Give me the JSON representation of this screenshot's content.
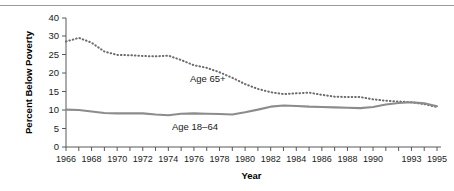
{
  "chart_data": {
    "type": "line",
    "title": "",
    "subtitle": "",
    "xlabel": "Year",
    "ylabel": "Percent Below Poverty",
    "xlim": [
      1966,
      1995
    ],
    "ylim": [
      0,
      40
    ],
    "grid": false,
    "legend_position": "inline-annotations",
    "x": [
      1966,
      1967,
      1968,
      1969,
      1970,
      1971,
      1972,
      1973,
      1974,
      1975,
      1976,
      1977,
      1978,
      1979,
      1980,
      1981,
      1982,
      1983,
      1984,
      1985,
      1986,
      1987,
      1988,
      1989,
      1990,
      1991,
      1992,
      1993,
      1994,
      1995
    ],
    "y_tick_labels": [
      "0",
      "5",
      "10",
      "15",
      "20",
      "25",
      "30",
      "40"
    ],
    "y_tick_values": [
      0,
      5,
      10,
      15,
      20,
      25,
      30,
      40
    ],
    "x_tick_labels": [
      "1966",
      "1968",
      "1970",
      "1972",
      "1974",
      "1976",
      "1978",
      "1980",
      "1982",
      "1984",
      "1986",
      "1988",
      "1990",
      "1993",
      "1995"
    ],
    "x_tick_values": [
      1966,
      1968,
      1970,
      1972,
      1974,
      1976,
      1978,
      1980,
      1982,
      1984,
      1986,
      1988,
      1990,
      1993,
      1995
    ],
    "series": [
      {
        "name": "Age 65+",
        "style": "dotted",
        "color": "#6b6b6b",
        "label_text": "Age 65+",
        "values": [
          28.5,
          29.5,
          28.2,
          25.8,
          24.9,
          24.8,
          24.6,
          24.5,
          24.7,
          23.5,
          22.1,
          21.4,
          20.2,
          18.7,
          17.0,
          15.7,
          14.8,
          14.3,
          14.5,
          14.7,
          14.1,
          13.6,
          13.5,
          13.5,
          12.9,
          12.5,
          12.3,
          12.1,
          11.6,
          10.8
        ]
      },
      {
        "name": "Age 18-64",
        "style": "solid",
        "color": "#8c8c8c",
        "label_text": "Age 18–64",
        "values": [
          10.1,
          10.0,
          9.6,
          9.2,
          9.1,
          9.1,
          9.1,
          8.8,
          8.6,
          9.0,
          9.1,
          9.0,
          8.9,
          8.8,
          9.4,
          10.1,
          10.9,
          11.2,
          11.1,
          10.9,
          10.8,
          10.7,
          10.6,
          10.5,
          10.8,
          11.5,
          11.9,
          12.1,
          11.8,
          11.0
        ]
      }
    ]
  }
}
